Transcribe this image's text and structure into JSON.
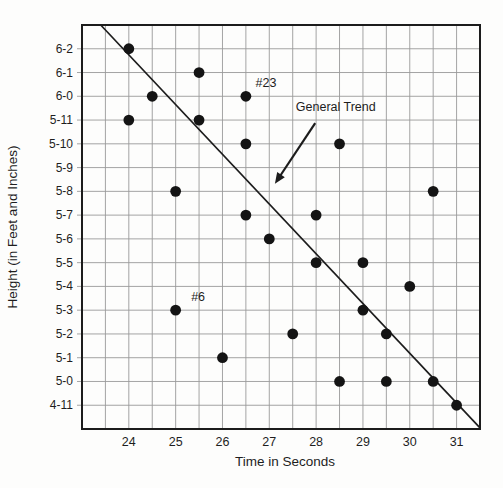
{
  "figure_type": "scatter-plot-figure",
  "chart_data": {
    "type": "scatter",
    "title": "",
    "xlabel": "Time in Seconds",
    "ylabel": "Height (in Feet and Inches)",
    "x_range": [
      23,
      31.5
    ],
    "y_range_inches": [
      58,
      75
    ],
    "x_grid_step": 0.5,
    "y_grid_step_inches": 1,
    "grid": true,
    "x_ticks": [
      24,
      25,
      26,
      27,
      28,
      29,
      30,
      31
    ],
    "y_ticks": [
      {
        "label": "6-2",
        "inches": 74
      },
      {
        "label": "6-1",
        "inches": 73
      },
      {
        "label": "6-0",
        "inches": 72
      },
      {
        "label": "5-11",
        "inches": 71
      },
      {
        "label": "5-10",
        "inches": 70
      },
      {
        "label": "5-9",
        "inches": 69
      },
      {
        "label": "5-8",
        "inches": 68
      },
      {
        "label": "5-7",
        "inches": 67
      },
      {
        "label": "5-6",
        "inches": 66
      },
      {
        "label": "5-5",
        "inches": 65
      },
      {
        "label": "5-4",
        "inches": 64
      },
      {
        "label": "5-3",
        "inches": 63
      },
      {
        "label": "5-2",
        "inches": 62
      },
      {
        "label": "5-1",
        "inches": 61
      },
      {
        "label": "5-0",
        "inches": 60
      },
      {
        "label": "4-11",
        "inches": 59
      }
    ],
    "points": [
      {
        "time": 24.0,
        "height": "6-2",
        "inches": 74
      },
      {
        "time": 24.5,
        "height": "6-0",
        "inches": 72
      },
      {
        "time": 25.5,
        "height": "6-1",
        "inches": 73
      },
      {
        "time": 26.5,
        "height": "6-0",
        "inches": 72,
        "tag": "#23"
      },
      {
        "time": 24.0,
        "height": "5-11",
        "inches": 71
      },
      {
        "time": 25.5,
        "height": "5-11",
        "inches": 71
      },
      {
        "time": 26.5,
        "height": "5-10",
        "inches": 70
      },
      {
        "time": 28.5,
        "height": "5-10",
        "inches": 70
      },
      {
        "time": 25.0,
        "height": "5-8",
        "inches": 68
      },
      {
        "time": 30.5,
        "height": "5-8",
        "inches": 68
      },
      {
        "time": 26.5,
        "height": "5-7",
        "inches": 67
      },
      {
        "time": 28.0,
        "height": "5-7",
        "inches": 67
      },
      {
        "time": 27.0,
        "height": "5-6",
        "inches": 66
      },
      {
        "time": 28.0,
        "height": "5-5",
        "inches": 65
      },
      {
        "time": 29.0,
        "height": "5-5",
        "inches": 65
      },
      {
        "time": 30.0,
        "height": "5-4",
        "inches": 64
      },
      {
        "time": 25.0,
        "height": "5-3",
        "inches": 63,
        "tag": "#6"
      },
      {
        "time": 29.0,
        "height": "5-3",
        "inches": 63
      },
      {
        "time": 27.5,
        "height": "5-2",
        "inches": 62
      },
      {
        "time": 29.5,
        "height": "5-2",
        "inches": 62
      },
      {
        "time": 26.0,
        "height": "5-1",
        "inches": 61
      },
      {
        "time": 28.5,
        "height": "5-0",
        "inches": 60
      },
      {
        "time": 29.5,
        "height": "5-0",
        "inches": 60
      },
      {
        "time": 30.5,
        "height": "5-0",
        "inches": 60
      },
      {
        "time": 31.0,
        "height": "4-11",
        "inches": 59
      }
    ],
    "trend_line": {
      "label": "General Trend",
      "x1": 23.4,
      "inches1": 75.0,
      "x2": 31.5,
      "inches2": 58.05
    },
    "annotations": [
      {
        "text": "#23",
        "x": 26.93,
        "inches": 72.55
      },
      {
        "text": "#6",
        "x": 25.48,
        "inches": 63.55
      },
      {
        "text": "General Trend",
        "x": 28.42,
        "inches": 71.55,
        "arrow": {
          "x1": 27.98,
          "inches1": 70.87,
          "x2": 27.12,
          "inches2": 68.32
        }
      }
    ],
    "colors": {
      "point": "#141414",
      "trend_line": "#1c1c1c",
      "grid": "#9a9a9a",
      "border": "#1c1c1c",
      "text": "#1e1e1e",
      "background": "#fdfdfc"
    }
  }
}
